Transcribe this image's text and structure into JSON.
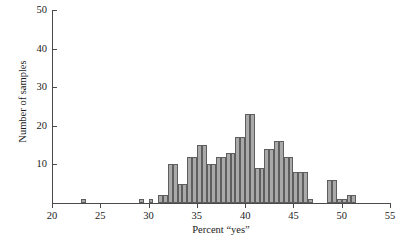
{
  "chart_data": {
    "type": "bar",
    "title": "",
    "subtitle": "",
    "xlabel": "Percent “yes”",
    "ylabel": "Number of samples",
    "xlim": [
      20,
      55
    ],
    "ylim": [
      0,
      50
    ],
    "grid": false,
    "legend": null,
    "bin_width": 0.5,
    "xticks": [
      20,
      25,
      30,
      35,
      40,
      45,
      50,
      55
    ],
    "xtick_labels": [
      "20",
      "25",
      "30",
      "35",
      "40",
      "45",
      "50",
      "55"
    ],
    "yticks": [
      10,
      20,
      30,
      40,
      50
    ],
    "ytick_labels": [
      "10",
      "20",
      "30",
      "40",
      "50"
    ],
    "bin_starts": [
      23.0,
      29.0,
      30.0,
      31.0,
      31.5,
      32.0,
      32.5,
      33.0,
      33.5,
      34.0,
      34.5,
      35.0,
      35.5,
      36.0,
      36.5,
      37.0,
      37.5,
      38.0,
      38.5,
      39.0,
      39.5,
      40.0,
      40.5,
      41.0,
      41.5,
      42.0,
      42.5,
      43.0,
      43.5,
      44.0,
      44.5,
      45.0,
      45.5,
      46.0,
      46.5,
      48.5,
      49.0,
      49.5,
      50.0,
      50.5,
      51.0
    ],
    "values": [
      1,
      1,
      1,
      2,
      2,
      10,
      10,
      5,
      5,
      12,
      12,
      15,
      15,
      10,
      10,
      12,
      12,
      13,
      13,
      17,
      17,
      23,
      23,
      9,
      9,
      14,
      14,
      16,
      16,
      12,
      12,
      8,
      8,
      8,
      1,
      6,
      6,
      1,
      1,
      2,
      2
    ],
    "bar_fill_color": "#a9a9a9",
    "bar_edge_color": "#5e5e5e",
    "axis_color": "#4a4a4a",
    "background_color": "#ffffff"
  },
  "axes": {
    "x_title": "Percent “yes”",
    "y_title": "Number of samples"
  }
}
